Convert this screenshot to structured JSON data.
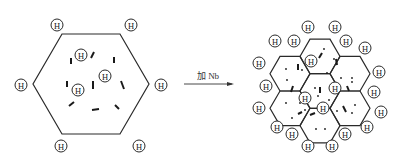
{
  "diagram": {
    "arrow_label": "加 Nb",
    "atom_label": "H",
    "colors": {
      "stroke": "#2a2a2a",
      "background": "#ffffff"
    },
    "before": {
      "description": "Single large hexagonal grain with hydrogen atoms at boundary and inside; short dislocation segments inside",
      "hexagon": [
        [
          62,
          34
        ],
        [
          120,
          34
        ],
        [
          149,
          84
        ],
        [
          120,
          134
        ],
        [
          62,
          134
        ],
        [
          33,
          84
        ]
      ],
      "outer_h": [
        [
          57,
          25
        ],
        [
          131,
          25
        ],
        [
          21,
          85
        ],
        [
          161,
          85
        ],
        [
          61,
          146
        ],
        [
          139,
          146
        ]
      ],
      "inner_h": [
        [
          81,
          55
        ],
        [
          105,
          76
        ],
        [
          78,
          90
        ]
      ],
      "dashes": [
        [
          71,
          58,
          71,
          64
        ],
        [
          94,
          52,
          91,
          58
        ],
        [
          114,
          57,
          114,
          63
        ],
        [
          67,
          81,
          67,
          87
        ],
        [
          93,
          81,
          93,
          89
        ],
        [
          121,
          81,
          124,
          89
        ],
        [
          69,
          106,
          74,
          102
        ],
        [
          92,
          110,
          99,
          109
        ],
        [
          115,
          105,
          119,
          109
        ]
      ]
    },
    "after": {
      "description": "Refined grains after Nb addition: seven smaller hexagonal grains, hydrogen distributed at many boundaries",
      "grain_radius": 20,
      "grain_centers": [
        [
          320,
          91
        ],
        [
          320,
          56.4
        ],
        [
          320,
          125.6
        ],
        [
          290,
          73.7
        ],
        [
          290,
          108.3
        ],
        [
          350,
          73.7
        ],
        [
          350,
          108.3
        ]
      ],
      "outer_h": [
        [
          308,
          27
        ],
        [
          335,
          27
        ],
        [
          275,
          41
        ],
        [
          294,
          41
        ],
        [
          346,
          41
        ],
        [
          365,
          48
        ],
        [
          259,
          63
        ],
        [
          379,
          72
        ],
        [
          266,
          86
        ],
        [
          374,
          92
        ],
        [
          259,
          108
        ],
        [
          381,
          112
        ],
        [
          277,
          127
        ],
        [
          292,
          134
        ],
        [
          345,
          134
        ],
        [
          367,
          127
        ],
        [
          308,
          146
        ],
        [
          332,
          146
        ]
      ],
      "inner_h": [
        [
          311,
          61
        ],
        [
          335,
          88
        ],
        [
          305,
          98
        ],
        [
          323,
          108
        ]
      ],
      "dashes": [
        [
          298,
          64,
          298,
          70
        ],
        [
          319,
          58,
          322,
          53
        ],
        [
          336,
          59,
          337,
          65
        ],
        [
          320,
          87,
          320,
          93
        ],
        [
          293,
          86,
          291,
          92
        ],
        [
          347,
          86,
          349,
          91
        ],
        [
          302,
          112,
          298,
          114
        ],
        [
          310,
          115,
          315,
          113
        ],
        [
          343,
          106,
          346,
          112
        ]
      ],
      "dots": [
        [
          324,
          49
        ],
        [
          334,
          59
        ],
        [
          286,
          69
        ],
        [
          302,
          70
        ],
        [
          287,
          80
        ],
        [
          327,
          73
        ],
        [
          341,
          78
        ],
        [
          352,
          78
        ],
        [
          315,
          88
        ],
        [
          318,
          96
        ],
        [
          352,
          82
        ],
        [
          338,
          87
        ],
        [
          286,
          103
        ],
        [
          292,
          118
        ],
        [
          305,
          110
        ],
        [
          329,
          100
        ],
        [
          355,
          105
        ],
        [
          352,
          113
        ],
        [
          337,
          111
        ],
        [
          316,
          129
        ],
        [
          325,
          129
        ],
        [
          300,
          103
        ]
      ]
    }
  }
}
